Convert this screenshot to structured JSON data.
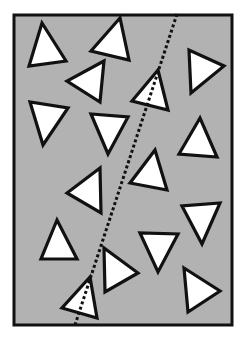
{
  "canvas": {
    "width": 251,
    "height": 339,
    "background": "#ffffff"
  },
  "colors": {
    "panel_fill": "#b2b2b2",
    "stroke": "#111111",
    "triangle_fill": "#ffffff"
  },
  "frame": {
    "x": 14,
    "y": 15,
    "width": 218,
    "height": 310
  },
  "dashed_line": {
    "x1": 177,
    "y1": 14,
    "x2": 75,
    "y2": 325
  },
  "triangles": [
    {
      "id": 1,
      "points": [
        [
          42,
          23
        ],
        [
          29,
          66
        ],
        [
          66,
          61
        ]
      ]
    },
    {
      "id": 2,
      "points": [
        [
          120,
          18
        ],
        [
          91,
          51
        ],
        [
          129,
          60
        ]
      ]
    },
    {
      "id": 3,
      "points": [
        [
          104,
          61
        ],
        [
          67,
          81
        ],
        [
          100,
          102
        ]
      ]
    },
    {
      "id": 4,
      "points": [
        [
          158,
          70
        ],
        [
          132,
          101
        ],
        [
          168,
          110
        ]
      ],
      "crossed_by_line": true
    },
    {
      "id": 5,
      "points": [
        [
          189,
          50
        ],
        [
          191,
          93
        ],
        [
          224,
          66
        ]
      ]
    },
    {
      "id": 6,
      "points": [
        [
          30,
          102
        ],
        [
          43,
          145
        ],
        [
          68,
          108
        ]
      ]
    },
    {
      "id": 7,
      "points": [
        [
          91,
          114
        ],
        [
          108,
          154
        ],
        [
          128,
          117
        ]
      ]
    },
    {
      "id": 8,
      "points": [
        [
          200,
          118
        ],
        [
          179,
          154
        ],
        [
          217,
          157
        ]
      ]
    },
    {
      "id": 9,
      "points": [
        [
          100,
          168
        ],
        [
          67,
          193
        ],
        [
          101,
          213
        ]
      ]
    },
    {
      "id": 10,
      "points": [
        [
          155,
          150
        ],
        [
          130,
          183
        ],
        [
          167,
          190
        ]
      ]
    },
    {
      "id": 11,
      "points": [
        [
          182,
          206
        ],
        [
          202,
          244
        ],
        [
          220,
          203
        ]
      ]
    },
    {
      "id": 12,
      "points": [
        [
          57,
          220
        ],
        [
          41,
          259
        ],
        [
          77,
          259
        ]
      ]
    },
    {
      "id": 13,
      "points": [
        [
          104,
          248
        ],
        [
          105,
          292
        ],
        [
          138,
          273
        ]
      ]
    },
    {
      "id": 14,
      "points": [
        [
          140,
          233
        ],
        [
          158,
          272
        ],
        [
          178,
          234
        ]
      ]
    },
    {
      "id": 15,
      "points": [
        [
          184,
          268
        ],
        [
          188,
          312
        ],
        [
          220,
          291
        ]
      ]
    },
    {
      "id": 16,
      "points": [
        [
          90,
          277
        ],
        [
          62,
          308
        ],
        [
          97,
          318
        ]
      ],
      "crossed_by_line": true
    }
  ],
  "counts": {
    "triangles": 16,
    "crossed_by_line": 2
  }
}
